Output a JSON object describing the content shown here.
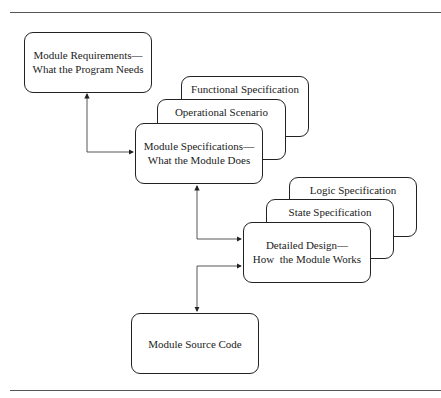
{
  "diagram": {
    "requirements": {
      "line1": "Module Requirements—",
      "line2": "What the Program Needs"
    },
    "specifications": {
      "functional": "Functional Specification",
      "operational": "Operational Scenario",
      "main_line1": "Module Specifications—",
      "main_line2": "What the Module Does"
    },
    "design": {
      "logic": "Logic Specification",
      "state": "State Specification",
      "main_line1": "Detailed Design—",
      "main_line2": "How  the Module Works"
    },
    "source": {
      "label": "Module Source Code"
    },
    "colors": {
      "line": "#222222",
      "rule": "#555555",
      "background": "#ffffff"
    }
  }
}
